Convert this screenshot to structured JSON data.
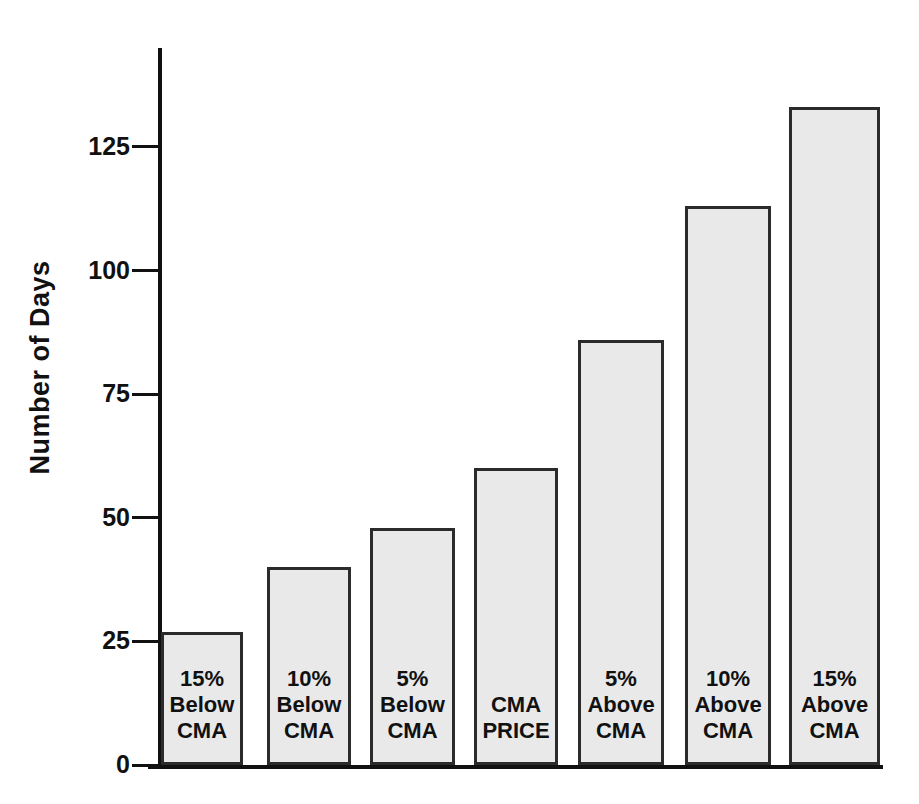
{
  "chart_data": {
    "type": "bar",
    "title": "",
    "xlabel": "",
    "ylabel": "Number of Days",
    "ylim": [
      0,
      145
    ],
    "yticks": [
      0,
      25,
      50,
      75,
      100,
      125
    ],
    "ytick_labels": [
      "0",
      "25",
      "50",
      "75",
      "100",
      "125"
    ],
    "grid": false,
    "legend": "none",
    "categories": [
      "15% Below CMA",
      "10% Below CMA",
      "5% Below CMA",
      "CMA PRICE",
      "5% Above CMA",
      "10% Above CMA",
      "15% Above CMA"
    ],
    "category_labels_multiline": [
      "15%\nBelow\nCMA",
      "10%\nBelow\nCMA",
      "5%\nBelow\nCMA",
      "CMA\nPRICE",
      "5%\nAbove\nCMA",
      "10%\nAbove\nCMA",
      "15%\nAbove\nCMA"
    ],
    "values": [
      27,
      40,
      48,
      60,
      86,
      113,
      133
    ],
    "bar_fill_color": "#e9e9e9",
    "bar_edge_color": "#2b2b2b",
    "axis_color": "#111111",
    "background_color": "#ffffff"
  }
}
